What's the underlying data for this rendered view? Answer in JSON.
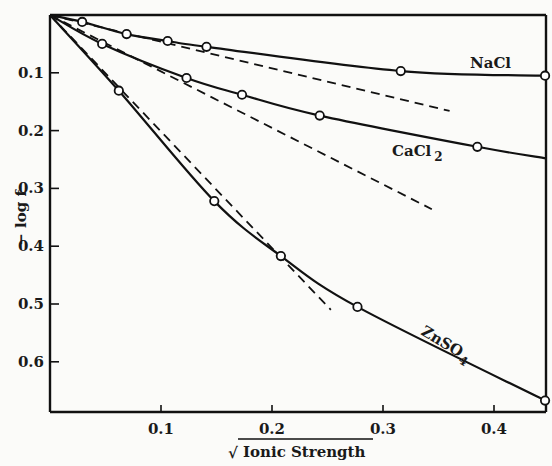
{
  "chart_data": {
    "type": "line",
    "title": "",
    "xlabel": "Ionic Strength",
    "xlabel_prefix": "√",
    "ylabel": "− log f",
    "xlim": [
      0,
      0.447
    ],
    "ylim": [
      0,
      0.68
    ],
    "y_inverted": true,
    "grid": false,
    "x_ticks": [
      0.1,
      0.2,
      0.3,
      0.4
    ],
    "x_tick_labels": [
      "0.1",
      "0.2",
      "0.3",
      "0.4"
    ],
    "y_ticks": [
      0.1,
      0.2,
      0.3,
      0.4,
      0.5,
      0.6
    ],
    "y_tick_labels": [
      "0.1",
      "0.2",
      "0.3",
      "0.4",
      "0.5",
      "0.6"
    ],
    "series": [
      {
        "name": "NaCl",
        "label": "NaCl",
        "style": "solid",
        "points": [
          [
            0,
            0
          ],
          [
            0.029,
            0.012
          ],
          [
            0.069,
            0.033
          ],
          [
            0.106,
            0.045
          ],
          [
            0.141,
            0.055
          ],
          [
            0.316,
            0.097
          ],
          [
            0.446,
            0.105
          ]
        ]
      },
      {
        "name": "CaCl2",
        "label": "CaCl",
        "label_sub": "2",
        "style": "solid",
        "points": [
          [
            0,
            0
          ],
          [
            0.047,
            0.05
          ],
          [
            0.123,
            0.109
          ],
          [
            0.173,
            0.138
          ],
          [
            0.243,
            0.174
          ],
          [
            0.385,
            0.228
          ]
        ],
        "line_end": [
          0.447,
          0.248
        ]
      },
      {
        "name": "ZnSO4",
        "label": "ZnSO",
        "label_sub": "4",
        "style": "solid",
        "points": [
          [
            0,
            0
          ],
          [
            0.062,
            0.131
          ],
          [
            0.148,
            0.322
          ],
          [
            0.208,
            0.417
          ],
          [
            0.277,
            0.505
          ],
          [
            0.446,
            0.667
          ]
        ]
      }
    ],
    "limiting_law_lines": [
      {
        "name": "NaCl-limiting",
        "style": "dashed",
        "from": [
          0,
          0
        ],
        "to": [
          0.36,
          0.166
        ]
      },
      {
        "name": "CaCl2-limiting",
        "style": "dashed",
        "from": [
          0,
          0
        ],
        "to": [
          0.344,
          0.336
        ]
      },
      {
        "name": "ZnSO4-limiting",
        "style": "dashed",
        "from": [
          0,
          0
        ],
        "to": [
          0.253,
          0.51
        ]
      }
    ]
  }
}
